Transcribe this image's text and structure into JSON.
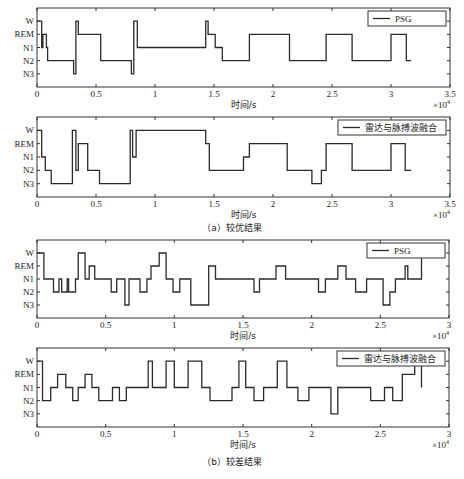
{
  "figure": {
    "captions": [
      "（a）较优结果",
      "（b）较差结果"
    ],
    "line_color": "#2b2b2b",
    "frame_color": "#333333"
  },
  "chart_data": [
    {
      "type": "line",
      "title": "",
      "legend": [
        "PSG"
      ],
      "legend_position": "upper right",
      "xlabel": "时间/s",
      "x_multiplier": "×10^4",
      "ylabel": "",
      "yticks": [
        "W",
        "REM",
        "N1",
        "N2",
        "N3"
      ],
      "xticks": [
        "0",
        "0.5",
        "1",
        "1.5",
        "2",
        "2.5",
        "3",
        "3.5"
      ],
      "xlim": [
        0,
        35000
      ],
      "grid": false,
      "x_steps": [
        0,
        400,
        500,
        800,
        900,
        1900,
        3100,
        3300,
        3500,
        4300,
        5400,
        8000,
        8200,
        8500,
        14300,
        14500,
        15100,
        15700,
        16400,
        17800,
        18000,
        21400,
        24300,
        24500,
        26700,
        27000,
        28200,
        28500,
        30000,
        31300,
        31700
      ],
      "y_steps": [
        "W",
        "N1",
        "REM",
        "N1",
        "N2",
        "N2",
        "N3",
        "W",
        "REM",
        "REM",
        "N2",
        "N3",
        "W",
        "N1",
        "W",
        "REM",
        "N1",
        "N2",
        "N2",
        "N2",
        "REM",
        "N2",
        "N2",
        "REM",
        "N2",
        "N2",
        "N2",
        "N2",
        "REM",
        "N2",
        "N2"
      ]
    },
    {
      "type": "line",
      "title": "",
      "legend": [
        "雷达与脉搏波融合"
      ],
      "legend_position": "upper right",
      "xlabel": "时间/s",
      "x_multiplier": "×10^4",
      "yticks": [
        "W",
        "REM",
        "N1",
        "N2",
        "N3"
      ],
      "xticks": [
        "0",
        "0.5",
        "1",
        "1.5",
        "2",
        "2.5",
        "3",
        "3.5"
      ],
      "xlim": [
        0,
        35000
      ],
      "grid": false,
      "x_steps": [
        0,
        400,
        700,
        1200,
        3000,
        3300,
        3500,
        4300,
        5300,
        7900,
        8100,
        8400,
        8800,
        14300,
        14600,
        14900,
        15700,
        17500,
        18000,
        21200,
        23300,
        24100,
        24500,
        26700,
        27100,
        28200,
        30000,
        31200,
        31700
      ],
      "y_steps": [
        "W",
        "N1",
        "N2",
        "N3",
        "W",
        "N2",
        "REM",
        "N2",
        "N3",
        "W",
        "N1",
        "W",
        "W",
        "REM",
        "N2",
        "N2",
        "N2",
        "N1",
        "REM",
        "N2",
        "N3",
        "N2",
        "REM",
        "N2",
        "N2",
        "N2",
        "REM",
        "N2",
        "N2"
      ]
    },
    {
      "type": "line",
      "title": "",
      "legend": [
        "PSG"
      ],
      "legend_position": "upper right",
      "xlabel": "时间/s",
      "x_multiplier": "×10^4",
      "yticks": [
        "W",
        "REM",
        "N1",
        "N2",
        "N3"
      ],
      "xticks": [
        "0",
        "0.5",
        "1",
        "1.5",
        "2",
        "2.5",
        "3"
      ],
      "xlim": [
        0,
        30000
      ],
      "grid": false,
      "x_steps": [
        0,
        500,
        1200,
        1600,
        1800,
        2200,
        2300,
        2800,
        3000,
        3500,
        3800,
        4200,
        5400,
        5800,
        6400,
        6700,
        7500,
        8000,
        8300,
        8900,
        9400,
        9900,
        10400,
        11200,
        12500,
        13000,
        13600,
        15800,
        16200,
        17400,
        18100,
        18700,
        20500,
        21000,
        21900,
        22500,
        23200,
        24000,
        25200,
        25700,
        26100,
        26800,
        27000,
        28000
      ],
      "y_steps": [
        "W",
        "N1",
        "N2",
        "N1",
        "N2",
        "N1",
        "N2",
        "N1",
        "W",
        "N1",
        "REM",
        "N1",
        "N2",
        "N1",
        "N3",
        "N1",
        "N2",
        "N1",
        "REM",
        "W",
        "N1",
        "N2",
        "N1",
        "N3",
        "REM",
        "N1",
        "N1",
        "N2",
        "N1",
        "REM",
        "N1",
        "N1",
        "N2",
        "N1",
        "REM",
        "N1",
        "N2",
        "N1",
        "N3",
        "N2",
        "N1",
        "REM",
        "N1",
        "W"
      ]
    },
    {
      "type": "line",
      "title": "",
      "legend": [
        "雷达与脉搏波融合"
      ],
      "legend_position": "upper right",
      "xlabel": "时间/s",
      "x_multiplier": "×10^4",
      "yticks": [
        "W",
        "REM",
        "N1",
        "N2",
        "N3"
      ],
      "xticks": [
        "0",
        "0.5",
        "1",
        "1.5",
        "2",
        "2.5",
        "3"
      ],
      "xlim": [
        0,
        30000
      ],
      "grid": false,
      "x_steps": [
        0,
        400,
        1000,
        1500,
        2100,
        2600,
        3000,
        3500,
        4000,
        4500,
        5500,
        6000,
        6500,
        8100,
        8400,
        9400,
        10000,
        11000,
        12000,
        12600,
        14200,
        14700,
        15200,
        15800,
        16500,
        17500,
        18200,
        19000,
        19800,
        21400,
        21900,
        22400,
        23500,
        24300,
        25300,
        25900,
        26600,
        27500,
        28000
      ],
      "y_steps": [
        "W",
        "N2",
        "N1",
        "REM",
        "N1",
        "N2",
        "N1",
        "REM",
        "N1",
        "N2",
        "N1",
        "N2",
        "N1",
        "W",
        "N1",
        "W",
        "N1",
        "W",
        "N1",
        "N2",
        "N1",
        "W",
        "N1",
        "N2",
        "N1",
        "W",
        "N1",
        "N2",
        "N1",
        "N3",
        "N1",
        "N1",
        "N1",
        "N2",
        "N1",
        "N2",
        "REM",
        "W",
        "N1"
      ]
    }
  ]
}
